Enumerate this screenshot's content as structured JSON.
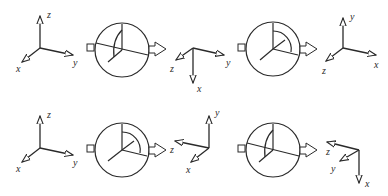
{
  "figure": {
    "rows": [
      {
        "input_frame": {
          "labels": {
            "x": "x",
            "y": "y",
            "z": "z"
          }
        },
        "stage_1": {
          "rotation_plane": "tilted",
          "arc": "small"
        },
        "intermediate_frame": {
          "labels": {
            "x": "x",
            "y": "y",
            "z": "z"
          }
        },
        "stage_2": {
          "rotation_plane": "vertical",
          "arc": "quarter"
        },
        "output_frame": {
          "labels": {
            "x": "x",
            "y": "y",
            "z": "z"
          }
        }
      },
      {
        "input_frame": {
          "labels": {
            "x": "x",
            "y": "y",
            "z": "z"
          }
        },
        "stage_1": {
          "rotation_plane": "vertical",
          "arc": "quarter"
        },
        "intermediate_frame": {
          "labels": {
            "x": "x",
            "y": "y",
            "z": "z"
          }
        },
        "stage_2": {
          "rotation_plane": "tilted",
          "arc": "small"
        },
        "output_frame": {
          "labels": {
            "x": "x",
            "y": "y",
            "z": "z"
          }
        }
      }
    ]
  }
}
